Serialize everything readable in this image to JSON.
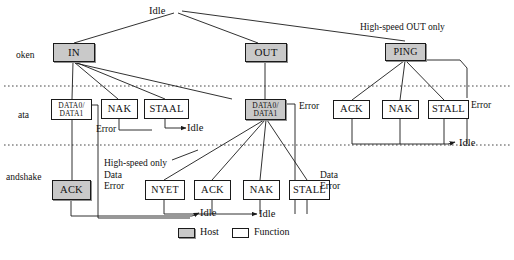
{
  "diagram": {
    "colors": {
      "host_fill": "#c9c9c9",
      "function_fill": "#ffffff",
      "stroke": "#1a1a1a",
      "background": "#ffffff"
    },
    "row_labels": [
      {
        "name": "token-row-label",
        "text": "oken",
        "x": 16,
        "y": 50
      },
      {
        "name": "data-row-label",
        "text": "ata",
        "x": 18,
        "y": 110
      },
      {
        "name": "handshake-row-label",
        "text": "andshake",
        "x": 6,
        "y": 172
      }
    ],
    "idle_labels": [
      {
        "name": "idle-root",
        "text": "Idle",
        "x": 149,
        "y": 5
      },
      {
        "name": "idle-data-in",
        "text": "Idle",
        "x": 187,
        "y": 122
      },
      {
        "name": "idle-handshake",
        "text": "Idle",
        "x": 200,
        "y": 207
      },
      {
        "name": "idle-out",
        "text": "Idle",
        "x": 259,
        "y": 208
      },
      {
        "name": "idle-ping",
        "text": "Idle",
        "x": 459,
        "y": 137
      }
    ],
    "annotations": [
      {
        "name": "high-speed-out-only-label",
        "text": "High-speed OUT only",
        "x": 360,
        "y": 22
      },
      {
        "name": "high-speed-only-label",
        "text": "High-speed only",
        "x": 104,
        "y": 158
      },
      {
        "name": "error-label-in",
        "text": "Error",
        "x": 96,
        "y": 128
      },
      {
        "name": "error-label-out",
        "text": "Error",
        "x": 299,
        "y": 105
      },
      {
        "name": "error-label-ping",
        "text": "Error",
        "x": 471,
        "y": 104
      },
      {
        "name": "data-error-label-in",
        "text": "Data\nError",
        "x": 104,
        "y": 172
      },
      {
        "name": "data-error-label-out",
        "text": "Data\nError",
        "x": 320,
        "y": 172
      }
    ],
    "nodes": [
      {
        "name": "node-in",
        "label": "IN",
        "type": "host",
        "x": 53,
        "y": 43,
        "w": 42,
        "h": 19,
        "font": 11
      },
      {
        "name": "node-out",
        "label": "OUT",
        "type": "host",
        "x": 245,
        "y": 43,
        "w": 42,
        "h": 19,
        "font": 11
      },
      {
        "name": "node-ping",
        "label": "PING",
        "type": "host",
        "x": 385,
        "y": 43,
        "w": 41,
        "h": 18,
        "font": 10
      },
      {
        "name": "node-data-in",
        "label": "DATA0/\nDATA1",
        "type": "function",
        "x": 51,
        "y": 99,
        "w": 41,
        "h": 21,
        "font": 7.5
      },
      {
        "name": "node-nak-data-in",
        "label": "NAK",
        "type": "function",
        "x": 101,
        "y": 99,
        "w": 37,
        "h": 20,
        "font": 10.5
      },
      {
        "name": "node-stall-data-in",
        "label": "STAAL",
        "type": "function",
        "x": 144,
        "y": 99,
        "w": 45,
        "h": 20,
        "font": 10.5
      },
      {
        "name": "node-data-out",
        "label": "DATA0/\nDATA1",
        "type": "host",
        "x": 245,
        "y": 99,
        "w": 41,
        "h": 21,
        "font": 7.5
      },
      {
        "name": "node-ack-ping",
        "label": "ACK",
        "type": "function",
        "x": 333,
        "y": 100,
        "w": 37,
        "h": 19,
        "font": 10.5
      },
      {
        "name": "node-nak-ping",
        "label": "NAK",
        "type": "function",
        "x": 382,
        "y": 100,
        "w": 37,
        "h": 19,
        "font": 10.5
      },
      {
        "name": "node-stall-ping",
        "label": "STALL",
        "type": "function",
        "x": 428,
        "y": 100,
        "w": 41,
        "h": 19,
        "font": 10.5
      },
      {
        "name": "node-ack-in",
        "label": "ACK",
        "type": "host",
        "x": 52,
        "y": 180,
        "w": 39,
        "h": 20,
        "font": 10.5
      },
      {
        "name": "node-nyet-out",
        "label": "NYET",
        "type": "function",
        "x": 145,
        "y": 180,
        "w": 40,
        "h": 20,
        "font": 10
      },
      {
        "name": "node-ack-out",
        "label": "ACK",
        "type": "function",
        "x": 194,
        "y": 180,
        "w": 37,
        "h": 20,
        "font": 10.5
      },
      {
        "name": "node-nak-out",
        "label": "NAK",
        "type": "function",
        "x": 243,
        "y": 180,
        "w": 37,
        "h": 20,
        "font": 10.5
      },
      {
        "name": "node-stall-out",
        "label": "STALL",
        "type": "function",
        "x": 289,
        "y": 180,
        "w": 41,
        "h": 20,
        "font": 10.5
      }
    ],
    "legend": {
      "host_label": "Host",
      "function_label": "Function",
      "host_swatch_x": 178,
      "host_swatch_y": 228,
      "host_text_x": 200,
      "function_swatch_x": 232,
      "function_swatch_y": 228,
      "function_text_x": 254,
      "text_y": 226
    }
  }
}
